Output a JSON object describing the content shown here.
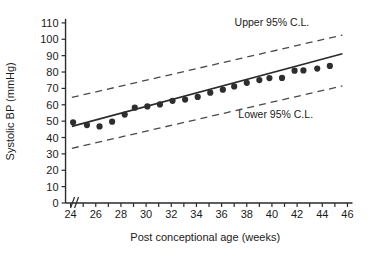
{
  "chart_data": {
    "type": "scatter",
    "title": "",
    "xlabel": "Post conceptional age (weeks)",
    "ylabel": "Systolic BP (mmHg)",
    "xlim": [
      23,
      46.6
    ],
    "ylim": [
      0,
      113
    ],
    "xticks": [
      24,
      25,
      26,
      27,
      28,
      29,
      30,
      31,
      32,
      33,
      34,
      35,
      36,
      37,
      38,
      39,
      40,
      41,
      42,
      43,
      44,
      45,
      46
    ],
    "xtick_labels": [
      "24",
      "",
      "26",
      "",
      "28",
      "",
      "30",
      "",
      "32",
      "",
      "34",
      "",
      "36",
      "",
      "38",
      "",
      "40",
      "",
      "42",
      "",
      "44",
      "",
      "46"
    ],
    "yticks": [
      0,
      10,
      20,
      30,
      40,
      50,
      60,
      70,
      80,
      90,
      100,
      110
    ],
    "ytick_labels": [
      "0",
      "10",
      "20",
      "30",
      "40",
      "50",
      "60",
      "70",
      "80",
      "90",
      "100",
      "110"
    ],
    "grid": false,
    "axis_break": "//",
    "legend_position": "none",
    "points": [
      {
        "x": 24.2,
        "y": 49.3
      },
      {
        "x": 25.3,
        "y": 47.6
      },
      {
        "x": 26.3,
        "y": 46.8
      },
      {
        "x": 27.3,
        "y": 49.7
      },
      {
        "x": 28.3,
        "y": 54.0
      },
      {
        "x": 29.1,
        "y": 58.2
      },
      {
        "x": 30.1,
        "y": 59.0
      },
      {
        "x": 31.1,
        "y": 60.2
      },
      {
        "x": 32.1,
        "y": 62.4
      },
      {
        "x": 33.1,
        "y": 63.2
      },
      {
        "x": 34.1,
        "y": 64.8
      },
      {
        "x": 35.1,
        "y": 67.4
      },
      {
        "x": 36.1,
        "y": 69.2
      },
      {
        "x": 37.0,
        "y": 71.2
      },
      {
        "x": 38.0,
        "y": 73.4
      },
      {
        "x": 39.0,
        "y": 75.1
      },
      {
        "x": 39.8,
        "y": 76.3
      },
      {
        "x": 40.8,
        "y": 76.4
      },
      {
        "x": 41.8,
        "y": 80.8
      },
      {
        "x": 42.5,
        "y": 81.0
      },
      {
        "x": 43.6,
        "y": 82.1
      },
      {
        "x": 44.6,
        "y": 83.7
      }
    ],
    "series": [
      {
        "name": "Regression line",
        "style": "solid",
        "x": [
          24.1,
          45.6
        ],
        "y": [
          46.8,
          91.2
        ]
      },
      {
        "name": "Upper 95% C.L.",
        "style": "dashed",
        "x": [
          24.1,
          45.6
        ],
        "y": [
          64.5,
          102.6
        ]
      },
      {
        "name": "Lower 95% C.L.",
        "style": "dashed",
        "x": [
          24.1,
          45.6
        ],
        "y": [
          33.4,
          71.5
        ]
      }
    ],
    "annotations": [
      {
        "text": "Upper 95% C.L.",
        "x": 40.0,
        "y": 108.0
      },
      {
        "text": "Lower 95% C.L.",
        "x": 40.3,
        "y": 52.0
      }
    ],
    "colors": {
      "axis": "#2b2b2b",
      "point": "#2e2e2e",
      "line": "#2b2b2b",
      "confidence_line": "#4a4a4a",
      "text": "#1a1a1a",
      "background": "#ffffff"
    }
  }
}
